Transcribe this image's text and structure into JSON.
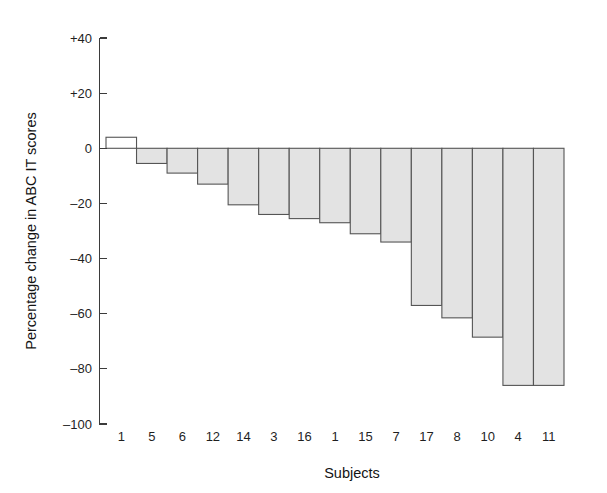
{
  "chart_data": {
    "type": "bar",
    "title": "",
    "xlabel": "Subjects",
    "ylabel": "Percentage change in ABC IT scores",
    "categories": [
      "1",
      "5",
      "6",
      "12",
      "14",
      "3",
      "16",
      "1",
      "15",
      "7",
      "17",
      "8",
      "10",
      "4",
      "11"
    ],
    "values": [
      4,
      -5.5,
      -9,
      -13,
      -20.5,
      -24,
      -25.5,
      -27,
      -31,
      -34,
      -57,
      -61.5,
      -68.5,
      -86,
      -86
    ],
    "ylim": [
      -100,
      40
    ],
    "xlim": [
      0,
      15
    ],
    "yticks": [
      40,
      20,
      0,
      -20,
      -40,
      -60,
      -80,
      -100
    ],
    "ytick_labels": [
      "+40",
      "+20",
      "0",
      "–20",
      "–40",
      "–60",
      "–80",
      "–100"
    ],
    "grid": false,
    "legend": null,
    "bar_fill_negative": "#e3e3e3",
    "bar_fill_positive": "#ffffff",
    "bar_stroke": "#555555",
    "axis_color": "#3b3b3b",
    "background": "#ffffff",
    "note": "Bars sorted descending by percentage change; first bar is the only positive value and is drawn unfilled."
  },
  "axes": {
    "x_title": "Subjects",
    "y_title": "Percentage change in ABC IT scores"
  }
}
